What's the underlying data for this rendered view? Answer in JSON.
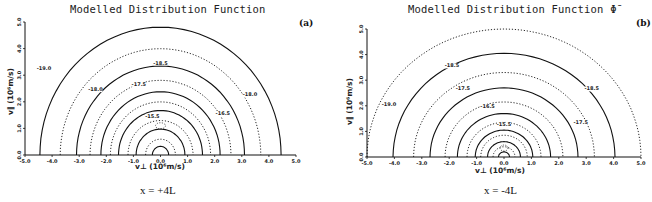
{
  "figure": {
    "panels": [
      {
        "id": "a",
        "title": "Modelled Distribution Function",
        "tag": "(a)",
        "caption": "x = +4L",
        "xlabel": "v⊥ (10⁶m/s)",
        "ylabel": "v∥ (10⁶m/s)",
        "xticks": [
          "-5.0",
          "-4.0",
          "-3.0",
          "-2.0",
          "-1.0",
          "0.0",
          "1.0",
          "2.0",
          "3.0",
          "4.0",
          "5.0"
        ],
        "yticks": [
          "0.0",
          "1.0",
          "2.0",
          "3.0",
          "4.0",
          "5.0"
        ],
        "contour_labels": [
          "-19.0",
          "-18.5",
          "-18.0",
          "-18.0",
          "-17.5",
          "-16.5",
          "-15.5"
        ]
      },
      {
        "id": "b",
        "title": "Modelled Distribution Function Φ̄",
        "tag": "(b)",
        "caption": "x = -4L",
        "xlabel": "v⊥ (10⁶m/s)",
        "ylabel": "v∥ (10⁶m/s)",
        "xticks": [
          "-5.0",
          "-4.0",
          "-3.0",
          "-2.0",
          "-1.0",
          "0.0",
          "1.0",
          "2.0",
          "3.0",
          "4.0",
          "5.0"
        ],
        "yticks": [
          "0.0",
          "1.0",
          "2.0",
          "3.0",
          "4.0",
          "5.0"
        ],
        "contour_labels": [
          "-19.0",
          "-18.5",
          "-18.5",
          "-17.5",
          "-17.5",
          "-16.5",
          "-15.5"
        ]
      }
    ]
  },
  "chart_data": [
    {
      "type": "contour",
      "title": "Modelled Distribution Function",
      "panel": "(a)",
      "subtitle": "x = +4L",
      "xlabel": "v⊥ (10^6 m/s)",
      "ylabel": "v∥ (10^6 m/s)",
      "xlim": [
        -5.0,
        5.0
      ],
      "ylim": [
        0.0,
        5.0
      ],
      "grid": false,
      "legend": "none",
      "line_styles": "alternating solid and dotted contours",
      "contour_levels": [
        -19.0,
        -18.5,
        -18.0,
        -17.5,
        -17.0,
        -16.5,
        -16.0,
        -15.5,
        -15.0
      ],
      "labeled_contours": [
        {
          "level": -19.0,
          "label_pos": [
            -4.3,
            3.2
          ]
        },
        {
          "level": -18.5,
          "label_pos": [
            0.0,
            3.4
          ]
        },
        {
          "level": -18.0,
          "label_pos": [
            -2.4,
            2.4
          ]
        },
        {
          "level": -18.0,
          "label_pos": [
            3.3,
            2.2
          ]
        },
        {
          "level": -17.5,
          "label_pos": [
            -0.8,
            2.6
          ]
        },
        {
          "level": -17.0,
          "label_pos": [
            2.3,
            1.5
          ]
        },
        {
          "level": -15.5,
          "label_pos": [
            -0.3,
            1.4
          ]
        }
      ],
      "contour_x_intercepts": [
        0.3,
        0.55,
        0.9,
        1.2,
        1.55,
        1.85,
        2.2,
        2.6,
        3.1,
        3.7,
        4.45
      ],
      "features": "nearly circular contours centered on origin; peak region ~v∥ 1.0–1.3; cusp near v∥≈2.6 on axis; outermost contour flattens near v∥≈4.8"
    },
    {
      "type": "contour",
      "title": "Modelled Distribution Function Φ̄",
      "panel": "(b)",
      "subtitle": "x = -4L",
      "xlabel": "v⊥ (10^6 m/s)",
      "ylabel": "v∥ (10^6 m/s)",
      "xlim": [
        -5.0,
        5.0
      ],
      "ylim": [
        0.0,
        5.0
      ],
      "grid": false,
      "legend": "none",
      "line_styles": "alternating solid and dotted contours",
      "contour_levels": [
        -19.0,
        -18.5,
        -18.0,
        -17.5,
        -17.0,
        -16.5,
        -16.0,
        -15.5,
        -15.0
      ],
      "labeled_contours": [
        {
          "level": -19.0,
          "label_pos": [
            -4.2,
            2.0
          ]
        },
        {
          "level": -18.5,
          "label_pos": [
            -1.9,
            3.5
          ]
        },
        {
          "level": -18.5,
          "label_pos": [
            3.2,
            2.6
          ]
        },
        {
          "level": -17.5,
          "label_pos": [
            -1.5,
            2.6
          ]
        },
        {
          "level": -17.5,
          "label_pos": [
            2.8,
            1.3
          ]
        },
        {
          "level": -16.5,
          "label_pos": [
            -0.6,
            1.9
          ]
        },
        {
          "level": -15.5,
          "label_pos": [
            0.0,
            1.2
          ]
        }
      ],
      "contour_x_intercepts": [
        0.2,
        0.4,
        0.6,
        0.85,
        1.05,
        1.35,
        1.7,
        2.15,
        2.7,
        3.3,
        4.05,
        5.0
      ],
      "features": "concentric contours centered at origin; secondary beam feature near v∥≈2.7 on axis; small closed islands near (±1.0, 2.1) and (±2.0, 3.7)"
    }
  ]
}
